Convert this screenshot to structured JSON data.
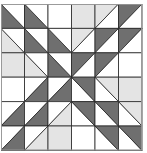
{
  "block": {
    "rows": 6,
    "cols": 6,
    "cell_w": 23.5,
    "cell_h": 24.4,
    "colors": {
      "D": "#6f6f6f",
      "L": "#e4e4e4",
      "W": "#ffffff",
      "line": "#262626",
      "border": "#9a9a9a"
    },
    "cells": [
      [
        {
          "diag": "tlbr",
          "a": "D",
          "b": "W"
        },
        {
          "diag": "tlbr",
          "a": "D",
          "b": "W"
        },
        {
          "fill": "W"
        },
        {
          "fill": "L"
        },
        {
          "diag": "bltr",
          "a": "L",
          "b": "W"
        },
        {
          "diag": "bltr",
          "a": "D",
          "b": "W"
        }
      ],
      [
        {
          "diag": "tlbr",
          "a": "L",
          "b": "W"
        },
        {
          "diag": "tlbr",
          "a": "D",
          "b": "W"
        },
        {
          "diag": "tlbr",
          "a": "D",
          "b": "W"
        },
        {
          "diag": "bltr",
          "a": "L",
          "b": "W"
        },
        {
          "diag": "bltr",
          "a": "D",
          "b": "W"
        },
        {
          "diag": "bltr",
          "a": "D",
          "b": "W"
        }
      ],
      [
        {
          "fill": "L"
        },
        {
          "diag": "tlbr",
          "a": "L",
          "b": "W"
        },
        {
          "diag": "tlbr",
          "a": "D",
          "b": "W"
        },
        {
          "diag": "bltr",
          "a": "D",
          "b": "W"
        },
        {
          "diag": "bltr",
          "a": "D",
          "b": "W"
        },
        {
          "fill": "W"
        }
      ],
      [
        {
          "fill": "W"
        },
        {
          "diag": "bltr",
          "a": "W",
          "b": "D"
        },
        {
          "diag": "bltr",
          "a": "W",
          "b": "D"
        },
        {
          "diag": "tlbr",
          "a": "W",
          "b": "D"
        },
        {
          "diag": "tlbr",
          "a": "W",
          "b": "L"
        },
        {
          "fill": "L"
        }
      ],
      [
        {
          "diag": "bltr",
          "a": "W",
          "b": "D"
        },
        {
          "diag": "bltr",
          "a": "W",
          "b": "D"
        },
        {
          "diag": "bltr",
          "a": "W",
          "b": "L"
        },
        {
          "diag": "tlbr",
          "a": "W",
          "b": "D"
        },
        {
          "diag": "tlbr",
          "a": "W",
          "b": "D"
        },
        {
          "diag": "tlbr",
          "a": "W",
          "b": "L"
        }
      ],
      [
        {
          "diag": "bltr",
          "a": "W",
          "b": "D"
        },
        {
          "diag": "bltr",
          "a": "W",
          "b": "L"
        },
        {
          "fill": "L"
        },
        {
          "fill": "W"
        },
        {
          "diag": "tlbr",
          "a": "W",
          "b": "D"
        },
        {
          "diag": "tlbr",
          "a": "W",
          "b": "D"
        }
      ]
    ]
  }
}
